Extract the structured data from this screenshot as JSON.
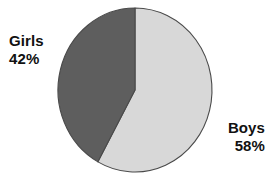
{
  "chart_data": {
    "type": "pie",
    "title": "",
    "categories": [
      "Girls",
      "Boys"
    ],
    "values": [
      42,
      58
    ],
    "value_unit": "%",
    "labels": [
      "Girls 42%",
      "Boys 58%"
    ],
    "slice_colors": [
      "#5e5e5e",
      "#d8d8d8"
    ],
    "start_angle_deg": 0,
    "direction": "clockwise",
    "legend": "none",
    "grid": false,
    "background": "#ffffff",
    "outline_color": "#4a4a4a"
  },
  "slices": [
    {
      "name": "Boys",
      "percent_text": "58%",
      "value": 58,
      "color": "#d8d8d8"
    },
    {
      "name": "Girls",
      "percent_text": "42%",
      "value": 42,
      "color": "#5e5e5e"
    }
  ],
  "labels": {
    "girls": {
      "name": "Girls",
      "percent": "42%"
    },
    "boys": {
      "name": "Boys",
      "percent": "58%"
    }
  }
}
